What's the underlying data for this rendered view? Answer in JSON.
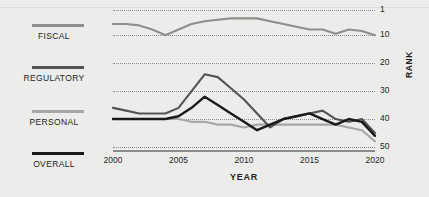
{
  "legend": {
    "items": [
      {
        "label": "FISCAL",
        "color": "#8e8e8c",
        "swatch": "legend-swatch-fiscal"
      },
      {
        "label": "REGULATORY",
        "color": "#545452",
        "swatch": "legend-swatch-regulatory"
      },
      {
        "label": "PERSONAL",
        "color": "#a7a7a5",
        "swatch": "legend-swatch-personal"
      },
      {
        "label": "OVERALL",
        "color": "#1a1a1a",
        "swatch": "legend-swatch-overall"
      }
    ]
  },
  "axes": {
    "x_title": "YEAR",
    "y_title": "RANK",
    "x_ticks": [
      "2000",
      "2005",
      "2010",
      "2015",
      "2020"
    ],
    "y_ticks": [
      "1",
      "10",
      "20",
      "30",
      "40",
      "50"
    ]
  },
  "chart_data": {
    "type": "line",
    "title": "",
    "subtitle": "",
    "xlabel": "YEAR",
    "ylabel": "RANK",
    "xlim": [
      2000,
      2020
    ],
    "ylim": [
      1,
      50
    ],
    "y_inverted": true,
    "grid": true,
    "gridlines_y": [
      1,
      10,
      20,
      30,
      40,
      50
    ],
    "x_ticks": [
      2000,
      2005,
      2010,
      2015,
      2020
    ],
    "y_ticks": [
      1,
      10,
      20,
      30,
      40,
      50
    ],
    "legend_position": "left",
    "x": [
      2000,
      2001,
      2002,
      2003,
      2004,
      2005,
      2006,
      2007,
      2008,
      2009,
      2010,
      2011,
      2012,
      2013,
      2014,
      2015,
      2016,
      2017,
      2018,
      2019,
      2020
    ],
    "series": [
      {
        "name": "FISCAL",
        "color": "#8e8e8c",
        "values": [
          6,
          6,
          6.5,
          8,
          10,
          8,
          6,
          5,
          4.5,
          4,
          4,
          4,
          5,
          6,
          7,
          8,
          8,
          9.5,
          8,
          8.5,
          10
        ]
      },
      {
        "name": "REGULATORY",
        "color": "#545452",
        "values": [
          36,
          37,
          38,
          38,
          38,
          36,
          30,
          24,
          25,
          29,
          33,
          38,
          43,
          40,
          39,
          38,
          37,
          40,
          41,
          40,
          45
        ]
      },
      {
        "name": "PERSONAL",
        "color": "#a7a7a5",
        "values": [
          40,
          40,
          40,
          40,
          40,
          40,
          41,
          41,
          42,
          42,
          43,
          42,
          42,
          42,
          42,
          42,
          42,
          42,
          43,
          44,
          48
        ]
      },
      {
        "name": "OVERALL",
        "color": "#1a1a1a",
        "values": [
          40,
          40,
          40,
          40,
          40,
          39,
          36,
          32,
          35,
          38,
          41,
          44,
          42,
          40,
          39,
          38,
          40,
          42,
          40,
          41,
          46
        ]
      }
    ]
  }
}
